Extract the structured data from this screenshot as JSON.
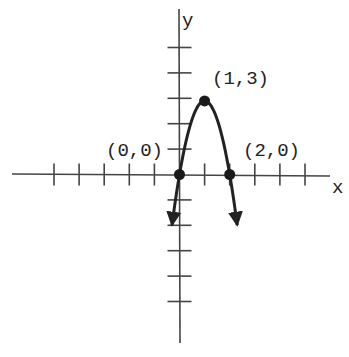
{
  "chart_data": {
    "type": "line",
    "title": "",
    "function": "y = -3x^2 + 6x",
    "xlabel": "x",
    "ylabel": "y",
    "xlim": [
      -5,
      6
    ],
    "ylim": [
      -6,
      6
    ],
    "grid": false,
    "x_ticks": [
      -5,
      -4,
      -3,
      -2,
      -1,
      1,
      2,
      3,
      4,
      5
    ],
    "y_ticks": [
      -5,
      -4,
      -3,
      -2,
      -1,
      1,
      2,
      3,
      4,
      5
    ],
    "points": [
      {
        "x": 0,
        "y": 0,
        "label": "(0,0)"
      },
      {
        "x": 1,
        "y": 3,
        "label": "(1,3)"
      },
      {
        "x": 2,
        "y": 0,
        "label": "(2,0)"
      }
    ],
    "curve_endpoints_with_arrows": [
      {
        "x": -0.3,
        "y": -2.4
      },
      {
        "x": 2.3,
        "y": -2.4
      }
    ],
    "colors": {
      "ink": "#222222",
      "background": "#ffffff"
    }
  },
  "labels": {
    "x_axis": "x",
    "y_axis": "y",
    "origin_point": "(0,0)",
    "vertex_point": "(1,3)",
    "root_point": "(2,0)"
  }
}
